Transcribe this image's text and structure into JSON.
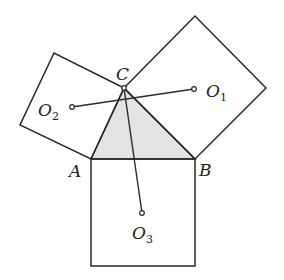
{
  "diagram": {
    "colors": {
      "stroke": "#2a2a2a",
      "triangle_fill": "#e3e3e3",
      "background": "#ffffff"
    },
    "points": {
      "A": {
        "label": "A",
        "x": 91,
        "y": 159
      },
      "B": {
        "label": "B",
        "x": 195,
        "y": 159
      },
      "C": {
        "label": "C",
        "x": 124,
        "y": 88
      },
      "O1": {
        "label": "O",
        "sub": "1",
        "x": 194,
        "y": 89
      },
      "O2": {
        "label": "O",
        "sub": "2",
        "x": 72,
        "y": 107
      },
      "O3": {
        "label": "O",
        "sub": "3",
        "x": 142,
        "y": 213
      }
    },
    "squares": {
      "on_AB": [
        [
          91,
          159
        ],
        [
          195,
          159
        ],
        [
          195,
          266
        ],
        [
          91,
          266
        ]
      ],
      "on_BC": [
        [
          124,
          88
        ],
        [
          195,
          16
        ],
        [
          266,
          88
        ],
        [
          195,
          159
        ]
      ],
      "on_CA": [
        [
          124,
          88
        ],
        [
          54,
          53
        ],
        [
          20,
          125
        ],
        [
          91,
          159
        ]
      ]
    },
    "segments": [
      {
        "from": "O1",
        "to": "O2"
      },
      {
        "from": "C",
        "to": "O3"
      }
    ]
  }
}
